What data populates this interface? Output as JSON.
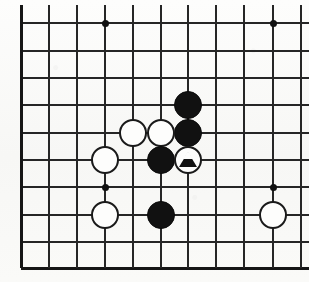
{
  "figure": {
    "kind": "go-board-diagram",
    "board_size": 19,
    "view": "cropped upper-left quadrant",
    "background_color": "#fbfbf9",
    "line_color": "#262626",
    "black_stone_color": "#111111",
    "white_stone_color": "#fdfdfc",
    "marker_color": "#111111"
  },
  "geometry": {
    "width": 309,
    "height": 282,
    "column_x": [
      21,
      49,
      77,
      105,
      133,
      161,
      188,
      216,
      244,
      273,
      301
    ],
    "row_y": [
      23,
      51,
      78,
      105,
      133,
      160,
      187,
      215,
      242,
      268
    ],
    "top_overhang_y": 5,
    "right_overhang_x": 309,
    "stone_radius": 14,
    "edges": {
      "left": true,
      "bottom": true,
      "top": false,
      "right": false
    }
  },
  "star_points": [
    {
      "name": "star-point-top-left",
      "x": 105,
      "y": 23
    },
    {
      "name": "star-point-top-right",
      "x": 273,
      "y": 23
    },
    {
      "name": "star-point-center-left",
      "x": 105,
      "y": 187
    },
    {
      "name": "star-point-center-right",
      "x": 273,
      "y": 187
    }
  ],
  "stones": [
    {
      "id": 1,
      "color": "black",
      "x": 188,
      "y": 105,
      "marker": "none",
      "label": "black-stone"
    },
    {
      "id": 2,
      "color": "black",
      "x": 188,
      "y": 133,
      "marker": "none",
      "label": "black-stone"
    },
    {
      "id": 3,
      "color": "white",
      "x": 133,
      "y": 133,
      "marker": "none",
      "label": "white-stone"
    },
    {
      "id": 4,
      "color": "white",
      "x": 161,
      "y": 133,
      "marker": "none",
      "label": "white-stone"
    },
    {
      "id": 5,
      "color": "white",
      "x": 105,
      "y": 160,
      "marker": "none",
      "label": "white-stone"
    },
    {
      "id": 6,
      "color": "black",
      "x": 161,
      "y": 160,
      "marker": "none",
      "label": "black-stone"
    },
    {
      "id": 7,
      "color": "white",
      "x": 188,
      "y": 160,
      "marker": "triangle",
      "label": "white-stone-marked-triangle"
    },
    {
      "id": 8,
      "color": "white",
      "x": 105,
      "y": 215,
      "marker": "none",
      "label": "white-stone"
    },
    {
      "id": 9,
      "color": "black",
      "x": 161,
      "y": 215,
      "marker": "none",
      "label": "black-stone"
    },
    {
      "id": 10,
      "color": "white",
      "x": 273,
      "y": 215,
      "marker": "none",
      "label": "white-stone"
    }
  ],
  "caption": {
    "text": ""
  }
}
